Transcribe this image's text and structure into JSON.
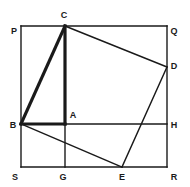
{
  "figure": {
    "background_color": "#ffffff",
    "stroke_color": "#1a1a1a",
    "thin_stroke_width": 1.4,
    "thick_stroke_width": 3.2,
    "label_color": "#1a1a1a",
    "label_font_size": 9
  },
  "geometry": {
    "square": {
      "name": "PQRS",
      "left": 21,
      "top": 26,
      "right": 167,
      "bottom": 167
    },
    "points": {
      "P": {
        "x": 21,
        "y": 26
      },
      "Q": {
        "x": 167,
        "y": 26
      },
      "R": {
        "x": 167,
        "y": 167
      },
      "S": {
        "x": 21,
        "y": 167
      },
      "B": {
        "x": 21,
        "y": 124
      },
      "C": {
        "x": 65,
        "y": 26
      },
      "D": {
        "x": 167,
        "y": 67
      },
      "E": {
        "x": 122,
        "y": 167
      },
      "A": {
        "x": 65,
        "y": 124
      },
      "G": {
        "x": 65,
        "y": 167
      },
      "H": {
        "x": 167,
        "y": 124
      }
    },
    "thin_segments": [
      {
        "name": "square-side-PQ",
        "from": "P",
        "to": "Q"
      },
      {
        "name": "square-side-QR",
        "from": "Q",
        "to": "R"
      },
      {
        "name": "square-side-RS",
        "from": "R",
        "to": "S"
      },
      {
        "name": "square-side-SP",
        "from": "S",
        "to": "P"
      },
      {
        "name": "quad-side-CD",
        "from": "C",
        "to": "D"
      },
      {
        "name": "quad-side-DE",
        "from": "D",
        "to": "E"
      },
      {
        "name": "quad-side-EB",
        "from": "E",
        "to": "B"
      },
      {
        "name": "construction-line-AH",
        "from": "A",
        "to": "H"
      },
      {
        "name": "construction-line-AG",
        "from": "A",
        "to": "G"
      }
    ],
    "thick_segments": [
      {
        "name": "quad-side-BC",
        "from": "B",
        "to": "C"
      },
      {
        "name": "altitude-CA",
        "from": "C",
        "to": "A"
      },
      {
        "name": "base-BA",
        "from": "B",
        "to": "A"
      }
    ]
  },
  "labels": [
    {
      "name": "vertex-label-P",
      "text": "P",
      "x": 14,
      "y": 31
    },
    {
      "name": "vertex-label-C",
      "text": "C",
      "x": 64,
      "y": 15
    },
    {
      "name": "vertex-label-Q",
      "text": "Q",
      "x": 174,
      "y": 31
    },
    {
      "name": "vertex-label-D",
      "text": "D",
      "x": 174,
      "y": 66
    },
    {
      "name": "vertex-label-A",
      "text": "A",
      "x": 73,
      "y": 115
    },
    {
      "name": "vertex-label-B",
      "text": "B",
      "x": 13,
      "y": 125
    },
    {
      "name": "vertex-label-H",
      "text": "H",
      "x": 174,
      "y": 125
    },
    {
      "name": "vertex-label-S",
      "text": "S",
      "x": 15,
      "y": 177
    },
    {
      "name": "vertex-label-G",
      "text": "G",
      "x": 63,
      "y": 177
    },
    {
      "name": "vertex-label-E",
      "text": "E",
      "x": 122,
      "y": 177
    },
    {
      "name": "vertex-label-R",
      "text": "R",
      "x": 174,
      "y": 177
    }
  ]
}
